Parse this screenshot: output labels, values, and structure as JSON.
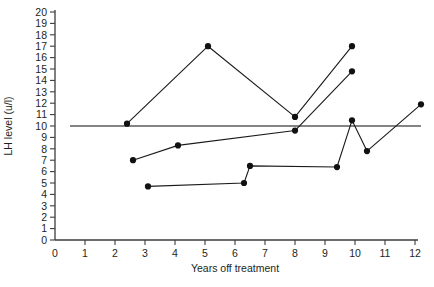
{
  "chart_data": {
    "type": "line",
    "title": "",
    "xlabel": "Years off treatment",
    "ylabel": "LH level (u/l)",
    "xlim": [
      0,
      12
    ],
    "ylim": [
      0,
      20
    ],
    "xticks": [
      0,
      1,
      2,
      3,
      4,
      5,
      6,
      7,
      8,
      9,
      10,
      11,
      12
    ],
    "xticklabels": [
      "0",
      "1",
      "2",
      "3",
      "4",
      "5",
      "6",
      "7",
      "8",
      "9",
      "10",
      "11",
      "12"
    ],
    "yticks": [
      0,
      1,
      2,
      3,
      4,
      5,
      6,
      7,
      8,
      9,
      10,
      11,
      12,
      13,
      14,
      15,
      16,
      17,
      18,
      19,
      20
    ],
    "yticklabels": [
      "0",
      "1",
      "2",
      "3",
      "4",
      "5",
      "6",
      "7",
      "8",
      "9",
      "10",
      "11",
      "12",
      "13",
      "14",
      "15",
      "16",
      "17",
      "18",
      "19",
      "20"
    ],
    "grid": false,
    "legend": false,
    "reference_lines": [
      {
        "name": "lh-threshold-line",
        "axis": "y",
        "value": 10,
        "x_from": 0.5,
        "x_to": 12.2
      }
    ],
    "series": [
      {
        "name": "patient-1",
        "marker": "filled-circle",
        "x": [
          2.4,
          5.1,
          8.0,
          9.9
        ],
        "y": [
          10.2,
          17.0,
          10.8,
          17.0
        ]
      },
      {
        "name": "patient-2",
        "marker": "filled-circle",
        "x": [
          2.6,
          4.1,
          8.0,
          9.9
        ],
        "y": [
          7.0,
          8.3,
          9.6,
          14.8
        ]
      },
      {
        "name": "patient-3",
        "marker": "filled-circle",
        "x": [
          3.1,
          6.3,
          6.5,
          9.4,
          9.9,
          10.4,
          12.2
        ],
        "y": [
          4.7,
          5.0,
          6.5,
          6.4,
          10.5,
          7.8,
          11.9
        ]
      }
    ]
  },
  "axes": {
    "x_axis_name": "Years off treatment",
    "y_axis_name": "LH level (u/l)"
  }
}
